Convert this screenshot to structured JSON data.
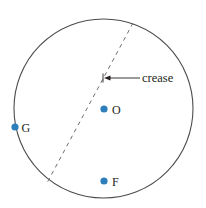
{
  "figure": {
    "background_color": "#ffffff",
    "stroke_color": "#4c4c4e",
    "dash_color": "#6e6e70",
    "label_color": "#231f20",
    "point_color": "#2e7ebb",
    "circle": {
      "center_x": 103.5,
      "center_y": 108.5,
      "radius": 89.5,
      "stroke_width": 1.1
    },
    "crease_line": {
      "x1": 133,
      "y1": 23,
      "x2": 47.5,
      "y2": 182,
      "dash_pattern": "4 4",
      "stroke_width": 1.0
    },
    "annotation": {
      "label": "crease",
      "label_x": 142,
      "label_y": 82,
      "arrow_tail_x": 140,
      "arrow_tail_y": 78,
      "arrow_tip_x": 104,
      "arrow_tip_y": 78
    },
    "points": [
      {
        "id": "O",
        "label": "O",
        "cx": 104,
        "cy": 109,
        "r": 3.6,
        "label_x": 112,
        "label_y": 113.5
      },
      {
        "id": "G",
        "label": "G",
        "cx": 15,
        "cy": 127,
        "r": 3.6,
        "label_x": 21.5,
        "label_y": 131.5
      },
      {
        "id": "F",
        "label": "F",
        "cx": 104,
        "cy": 181,
        "r": 3.6,
        "label_x": 112,
        "label_y": 185.5
      }
    ]
  }
}
